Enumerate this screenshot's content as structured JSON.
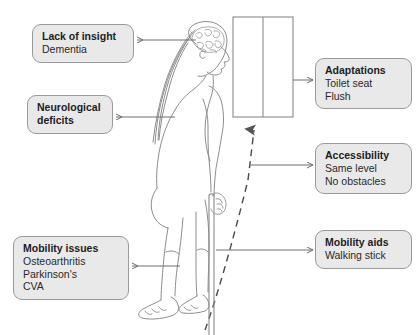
{
  "diagram": {
    "background_color": "#ffffff",
    "box_fill": "#e9e9e9",
    "box_border": "#9a9a9a",
    "line_color": "#6e6e6e",
    "figure_line_color": "#7a7a7a"
  },
  "callouts": [
    {
      "id": "lack-of-insight",
      "title": "Lack of insight",
      "lines": [
        "Dementia"
      ],
      "side": "left"
    },
    {
      "id": "neurological-deficits",
      "title": "Neurological",
      "lines": [
        "deficits"
      ],
      "side": "left"
    },
    {
      "id": "mobility-issues",
      "title": "Mobility issues",
      "lines": [
        "Osteoarthritis",
        "Parkinson's",
        "CVA"
      ],
      "side": "left"
    },
    {
      "id": "adaptations",
      "title": "Adaptations",
      "lines": [
        "Toilet seat",
        "Flush"
      ],
      "side": "right"
    },
    {
      "id": "accessibility",
      "title": "Accessibility",
      "lines": [
        "Same level",
        "No obstacles"
      ],
      "side": "right"
    },
    {
      "id": "mobility-aids",
      "title": "Mobility aids",
      "lines": [
        "Walking stick"
      ],
      "side": "right"
    }
  ],
  "figure": {
    "name": "elderly-person-profile"
  },
  "objects": [
    {
      "id": "toilet-cubicle",
      "name": "toilet-door-cubicle",
      "description": "Rectangle with central vertical divider representing a toilet door or cubicle"
    },
    {
      "id": "walking-stick",
      "name": "walking-stick",
      "description": "Vertical walking stick held in the right hand"
    },
    {
      "id": "path-arrow",
      "name": "dashed-path-arrow",
      "description": "Dashed arrow indicating route of travel toward the toilet"
    }
  ]
}
